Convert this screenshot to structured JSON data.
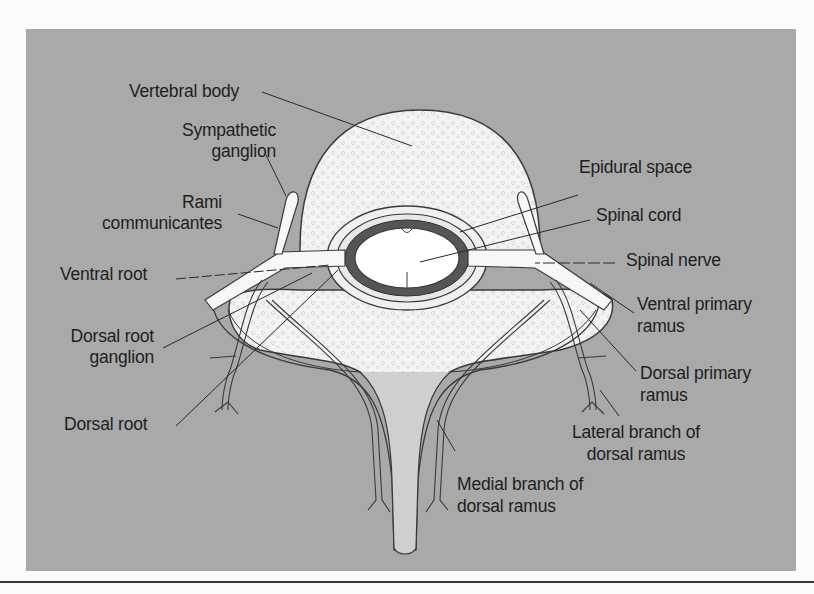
{
  "figure": {
    "colors": {
      "background_panel": "#a9a9a9",
      "bone": "#f2f2f2",
      "outline": "#3a3a3a",
      "dura_dark": "#555555",
      "lamina_light": "#d4d4d4",
      "text": "#1e1e1e"
    },
    "labels": {
      "vertebral_body": "Vertebral body",
      "sympathetic_ganglion_1": "Sympathetic",
      "sympathetic_ganglion_2": "ganglion",
      "rami_1": "Rami",
      "rami_2": "communicantes",
      "ventral_root": "Ventral root",
      "drg_1": "Dorsal root",
      "drg_2": "ganglion",
      "dorsal_root": "Dorsal root",
      "epidural_space": "Epidural space",
      "spinal_cord": "Spinal cord",
      "spinal_nerve": "Spinal nerve",
      "vpr_1": "Ventral primary",
      "vpr_2": "ramus",
      "dpr_1": "Dorsal primary",
      "dpr_2": "ramus",
      "lateral_1": "Lateral branch of",
      "lateral_2": "dorsal ramus",
      "medial_1": "Medial branch of",
      "medial_2": "dorsal ramus"
    }
  }
}
